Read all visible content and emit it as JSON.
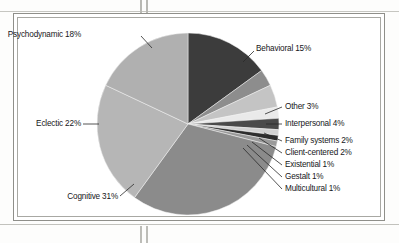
{
  "figure": {
    "frame_present": true,
    "background_color": "#ffffff"
  },
  "chart_data": {
    "type": "pie",
    "title": "",
    "subtitle": "",
    "xlabel": "",
    "ylabel": "",
    "legend_position": "none",
    "labels_position": "callout-outside",
    "grid": false,
    "units": "percent",
    "total": 100,
    "start_angle_deg": 0,
    "direction": "clockwise",
    "categories": [
      "Behavioral",
      "Other",
      "Interpersonal",
      "Family systems",
      "Client-centered",
      "Existential",
      "Gestalt",
      "Multicultural",
      "Cognitive",
      "Eclectic",
      "Psychodynamic"
    ],
    "values": [
      15,
      3,
      4,
      2,
      2,
      1,
      1,
      1,
      31,
      22,
      18
    ],
    "slices": [
      {
        "name": "Behavioral",
        "value": 15,
        "label": "Behavioral 15%",
        "color": "#3c3c3c"
      },
      {
        "name": "Other",
        "value": 3,
        "label": "Other 3%",
        "color": "#8d8d8d"
      },
      {
        "name": "Interpersonal",
        "value": 4,
        "label": "Interpersonal 4%",
        "color": "#c4c4c4"
      },
      {
        "name": "Family systems",
        "value": 2,
        "label": "Family systems 2%",
        "color": "#eaeaea"
      },
      {
        "name": "Client-centered",
        "value": 2,
        "label": "Client-centered 2%",
        "color": "#4a4a4a"
      },
      {
        "name": "Existential",
        "value": 1,
        "label": "Existential 1%",
        "color": "#d2d2d2"
      },
      {
        "name": "Gestalt",
        "value": 1,
        "label": "Gestalt 1%",
        "color": "#2e2e2e"
      },
      {
        "name": "Multicultural",
        "value": 1,
        "label": "Multicultural 1%",
        "color": "#9a9a9a"
      },
      {
        "name": "Cognitive",
        "value": 31,
        "label": "Cognitive 31%",
        "color": "#8b8b8b"
      },
      {
        "name": "Eclectic",
        "value": 22,
        "label": "Eclectic 22%",
        "color": "#b6b6b6"
      },
      {
        "name": "Psychodynamic",
        "value": 18,
        "label": "Psychodynamic 18%",
        "color": "#b0b0b0"
      }
    ]
  },
  "labels": {
    "psychodynamic": "Psychodynamic 18%",
    "behavioral": "Behavioral 15%",
    "other": "Other 3%",
    "interpersonal": "Interpersonal 4%",
    "family_systems": "Family systems 2%",
    "client_centered": "Client-centered 2%",
    "existential": "Existential 1%",
    "gestalt": "Gestalt 1%",
    "multicultural": "Multicultural 1%",
    "eclectic": "Eclectic 22%",
    "cognitive": "Cognitive 31%"
  }
}
